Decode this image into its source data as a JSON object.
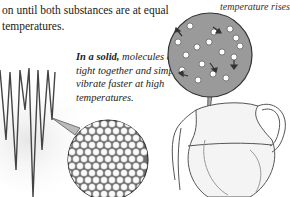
{
  "text": {
    "intro": "on until both substances are at equal temperatures.",
    "top_right_caption": "temperature rises",
    "solid_caption_lead": "In a solid,",
    "solid_caption_rest": " molecules are held tight together and simply vibrate faster at high temperatures."
  },
  "illustrations": {
    "icicles": "icicles-illustration",
    "solid_circle": "solid-molecules-circle",
    "liquid_circle": "liquid-molecules-circle",
    "jug": "water-jug-illustration"
  },
  "colors": {
    "text": "#1a1a1a",
    "circle_gray": "#9a9a9a",
    "shadow_gray": "#d8d8d8"
  }
}
